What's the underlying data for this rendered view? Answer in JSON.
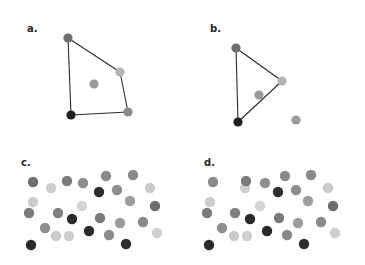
{
  "figure": {
    "background": "#ffffff",
    "width": 365,
    "height": 265,
    "dot_radius_hull": 4.6,
    "dot_radius_cluster": 5.2,
    "edge_color": "#2b2b2b",
    "edge_width": 1.1
  },
  "panels": [
    {
      "id": "a",
      "label": "a.",
      "label_x": 27,
      "label_y": 24,
      "type": "convex-hull",
      "points": [
        {
          "name": "hull-vertex-top-left",
          "x": 68,
          "y": 38,
          "color": "#6e6e6e",
          "hull": true
        },
        {
          "name": "hull-vertex-right",
          "x": 120,
          "y": 72,
          "color": "#b4b4b4",
          "hull": true
        },
        {
          "name": "hull-vertex-bottom-right",
          "x": 128,
          "y": 112,
          "color": "#8a8a8a",
          "hull": true
        },
        {
          "name": "hull-vertex-bottom-left",
          "x": 71,
          "y": 115,
          "color": "#1f1f1f",
          "hull": true
        },
        {
          "name": "interior-point",
          "x": 94,
          "y": 84,
          "color": "#9a9a9a",
          "hull": false
        }
      ],
      "hull_order": [
        0,
        1,
        2,
        3
      ]
    },
    {
      "id": "b",
      "label": "b.",
      "label_x": 210,
      "label_y": 24,
      "type": "convex-hull",
      "points": [
        {
          "name": "hull-vertex-top-left",
          "x": 236,
          "y": 48,
          "color": "#6e6e6e",
          "hull": true
        },
        {
          "name": "hull-vertex-right",
          "x": 282,
          "y": 81,
          "color": "#b4b4b4",
          "hull": true
        },
        {
          "name": "hull-vertex-bottom-left",
          "x": 238,
          "y": 122,
          "color": "#1f1f1f",
          "hull": true
        },
        {
          "name": "interior-point",
          "x": 259,
          "y": 95,
          "color": "#9a9a9a",
          "hull": false
        },
        {
          "name": "outlier-point",
          "x": 296,
          "y": 120,
          "color": "#9a9a9a",
          "hull": false
        }
      ],
      "hull_order": [
        0,
        1,
        2
      ]
    },
    {
      "id": "c",
      "label": "c.",
      "label_x": 21,
      "label_y": 158,
      "type": "cluster",
      "points": [
        {
          "x": 33,
          "y": 182,
          "color": "#6e6e6e"
        },
        {
          "x": 51,
          "y": 188,
          "color": "#cfcfcf"
        },
        {
          "x": 67,
          "y": 181,
          "color": "#7b7b7b"
        },
        {
          "x": 83,
          "y": 183,
          "color": "#8f8f8f"
        },
        {
          "x": 106,
          "y": 176,
          "color": "#8a8a8a"
        },
        {
          "x": 133,
          "y": 175,
          "color": "#8a8a8a"
        },
        {
          "x": 33,
          "y": 202,
          "color": "#cccccc"
        },
        {
          "x": 99,
          "y": 192,
          "color": "#2e2e2e"
        },
        {
          "x": 117,
          "y": 190,
          "color": "#8f8f8f"
        },
        {
          "x": 150,
          "y": 188,
          "color": "#c9c9c9"
        },
        {
          "x": 29,
          "y": 213,
          "color": "#7b7b7b"
        },
        {
          "x": 58,
          "y": 213,
          "color": "#7f7f7f"
        },
        {
          "x": 82,
          "y": 206,
          "color": "#d4d4d4"
        },
        {
          "x": 130,
          "y": 201,
          "color": "#9c9c9c"
        },
        {
          "x": 155,
          "y": 206,
          "color": "#6e6e6e"
        },
        {
          "x": 72,
          "y": 219,
          "color": "#2b2b2b"
        },
        {
          "x": 100,
          "y": 218,
          "color": "#7b7b7b"
        },
        {
          "x": 120,
          "y": 223,
          "color": "#9c9c9c"
        },
        {
          "x": 143,
          "y": 222,
          "color": "#8a8a8a"
        },
        {
          "x": 45,
          "y": 228,
          "color": "#8f8f8f"
        },
        {
          "x": 56,
          "y": 236,
          "color": "#c9c9c9"
        },
        {
          "x": 69,
          "y": 236,
          "color": "#cfcfcf"
        },
        {
          "x": 89,
          "y": 231,
          "color": "#2b2b2b"
        },
        {
          "x": 109,
          "y": 235,
          "color": "#8a8a8a"
        },
        {
          "x": 157,
          "y": 233,
          "color": "#cfcfcf"
        },
        {
          "x": 31,
          "y": 245,
          "color": "#2b2b2b"
        },
        {
          "x": 126,
          "y": 244,
          "color": "#2e2e2e"
        }
      ]
    },
    {
      "id": "d",
      "label": "d.",
      "label_x": 204,
      "label_y": 158,
      "type": "cluster",
      "points": [
        {
          "x": 213,
          "y": 182,
          "color": "#8a8a8a"
        },
        {
          "x": 245,
          "y": 188,
          "color": "#cfcfcf"
        },
        {
          "x": 246,
          "y": 181,
          "color": "#7b7b7b"
        },
        {
          "x": 265,
          "y": 183,
          "color": "#8f8f8f"
        },
        {
          "x": 285,
          "y": 176,
          "color": "#8a8a8a"
        },
        {
          "x": 311,
          "y": 175,
          "color": "#8a8a8a"
        },
        {
          "x": 210,
          "y": 202,
          "color": "#cccccc"
        },
        {
          "x": 278,
          "y": 192,
          "color": "#2e2e2e"
        },
        {
          "x": 296,
          "y": 190,
          "color": "#8f8f8f"
        },
        {
          "x": 328,
          "y": 188,
          "color": "#c9c9c9"
        },
        {
          "x": 207,
          "y": 213,
          "color": "#7b7b7b"
        },
        {
          "x": 235,
          "y": 213,
          "color": "#7f7f7f"
        },
        {
          "x": 260,
          "y": 206,
          "color": "#d4d4d4"
        },
        {
          "x": 308,
          "y": 201,
          "color": "#9c9c9c"
        },
        {
          "x": 333,
          "y": 206,
          "color": "#6e6e6e"
        },
        {
          "x": 250,
          "y": 219,
          "color": "#2b2b2b"
        },
        {
          "x": 279,
          "y": 218,
          "color": "#7b7b7b"
        },
        {
          "x": 298,
          "y": 223,
          "color": "#9c9c9c"
        },
        {
          "x": 321,
          "y": 222,
          "color": "#8a8a8a"
        },
        {
          "x": 222,
          "y": 228,
          "color": "#8f8f8f"
        },
        {
          "x": 234,
          "y": 236,
          "color": "#c9c9c9"
        },
        {
          "x": 247,
          "y": 236,
          "color": "#cfcfcf"
        },
        {
          "x": 267,
          "y": 231,
          "color": "#2b2b2b"
        },
        {
          "x": 287,
          "y": 235,
          "color": "#8a8a8a"
        },
        {
          "x": 335,
          "y": 233,
          "color": "#cfcfcf"
        },
        {
          "x": 209,
          "y": 245,
          "color": "#2b2b2b"
        },
        {
          "x": 304,
          "y": 244,
          "color": "#2e2e2e"
        }
      ]
    }
  ],
  "chart_data": {
    "type": "scatter",
    "title": "",
    "xlabel": "",
    "ylabel": "",
    "grid": false,
    "legend": "none",
    "subplots": [
      {
        "label": "a.",
        "description": "Four points forming a convex quadrilateral hull with one interior point",
        "hull_vertex_count": 4,
        "interior_point_count": 1,
        "total_points": 5
      },
      {
        "label": "b.",
        "description": "Three points forming a triangular hull with one interior point and one point outside",
        "hull_vertex_count": 3,
        "interior_point_count": 1,
        "exterior_point_count": 1,
        "total_points": 5
      },
      {
        "label": "c.",
        "description": "Dense cluster of grayscale dots, no hull drawn",
        "total_points": 27
      },
      {
        "label": "d.",
        "description": "Dense cluster of grayscale dots, no hull drawn",
        "total_points": 27
      }
    ]
  }
}
